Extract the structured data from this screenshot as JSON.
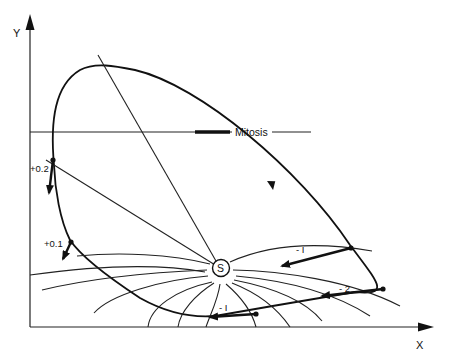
{
  "axes": {
    "x_label": "X",
    "y_label": "Y"
  },
  "mitosis_label": "Mitosis",
  "singular_point_label": "S",
  "phase_labels": {
    "plus_0_2": "+0.2",
    "plus_0_1": "+0.1",
    "minus_1_upper": "- I",
    "minus_2": "- 2",
    "minus_1_lower": "- I"
  },
  "colors": {
    "ink": "#111111",
    "background": "#ffffff"
  }
}
